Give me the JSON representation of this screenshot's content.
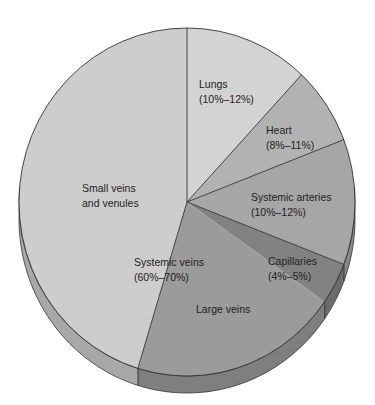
{
  "chart_data": {
    "type": "pie",
    "title": "",
    "style": "3d-tilted-pie",
    "slices": [
      {
        "name": "Lungs",
        "label": "Lungs",
        "range": "(10%–12%)",
        "value_min": 10,
        "value_max": 12,
        "color": "#d3d3d3"
      },
      {
        "name": "Heart",
        "label": "Heart",
        "range": "(8%–11%)",
        "value_min": 8,
        "value_max": 11,
        "color": "#b2b2b2"
      },
      {
        "name": "Systemic arteries",
        "label": "Systemic arteries",
        "range": "(10%–12%)",
        "value_min": 10,
        "value_max": 12,
        "color": "#a6a6a6"
      },
      {
        "name": "Capillaries",
        "label": "Capillaries",
        "range": "(4%–5%)",
        "value_min": 4,
        "value_max": 5,
        "color": "#828282"
      },
      {
        "name": "Large veins",
        "label": "Large veins",
        "color": "#9b9b9b"
      },
      {
        "name": "Small veins and venules",
        "label_lines": [
          "Small veins",
          "and venules"
        ],
        "color": "#cdcdcd"
      }
    ],
    "group_label": {
      "name": "Systemic veins",
      "label": "Systemic veins",
      "range": "(60%–70%)",
      "value_min": 60,
      "value_max": 70
    },
    "legend": "none"
  },
  "labels": {
    "lungs": {
      "name": "Lungs",
      "range": "(10%–12%)"
    },
    "heart": {
      "name": "Heart",
      "range": "(8%–11%)"
    },
    "arteries": {
      "name": "Systemic arteries",
      "range": "(10%–12%)"
    },
    "capillaries": {
      "name": "Capillaries",
      "range": "(4%–5%)"
    },
    "large_veins": {
      "name": "Large veins"
    },
    "small_veins": {
      "line1": "Small veins",
      "line2": "and venules"
    },
    "systemic_veins": {
      "name": "Systemic veins",
      "range": "(60%–70%)"
    }
  }
}
